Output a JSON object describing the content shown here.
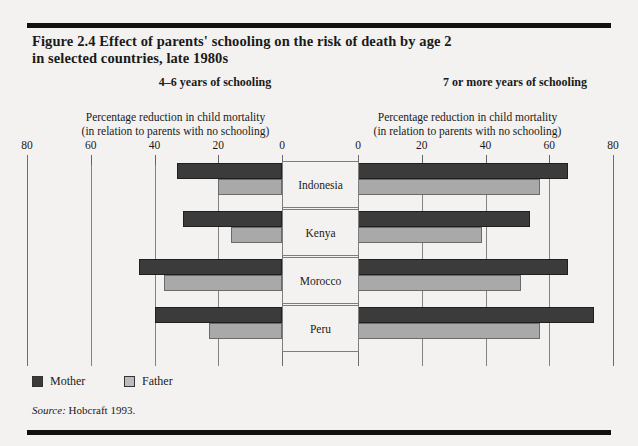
{
  "figure": {
    "title_line1": "Figure 2.4  Effect of parents' schooling on the risk of death by age 2",
    "title_line2": "in selected countries, late 1980s",
    "source_label": "Source:",
    "source_text": "Hobcraft 1993."
  },
  "legend": {
    "mother_label": "Mother",
    "father_label": "Father",
    "mother_color": "#3b3b3b",
    "father_color": "#bcbcbc"
  },
  "panels": {
    "left_heading": "4–6 years of schooling",
    "right_heading": "7 or more years of schooling",
    "caption_line1": "Percentage reduction in child mortality",
    "caption_line2": "(in relation to parents with no schooling)",
    "left_ticks": [
      "80",
      "60",
      "40",
      "20",
      "0"
    ],
    "right_ticks": [
      "0",
      "20",
      "40",
      "60",
      "80"
    ]
  },
  "chart_data": {
    "type": "bar",
    "orientation": "horizontal",
    "layout": "mirrored-pyramid",
    "title": "Figure 2.4  Effect of parents' schooling on the risk of death by age 2 in selected countries, late 1980s",
    "xlabel": "Percentage reduction in child mortality (in relation to parents with no schooling)",
    "ylabel": "",
    "categories": [
      "Indonesia",
      "Kenya",
      "Morocco",
      "Peru"
    ],
    "xlim": [
      0,
      80
    ],
    "xticks": [
      0,
      20,
      40,
      60,
      80
    ],
    "grid": true,
    "legend": [
      "Mother",
      "Father"
    ],
    "legend_position": "bottom-left",
    "panels": [
      {
        "name": "4–6 years of schooling",
        "direction": "left",
        "series": [
          {
            "name": "Mother",
            "values": [
              33,
              31,
              45,
              40
            ]
          },
          {
            "name": "Father",
            "values": [
              20,
              16,
              37,
              23
            ]
          }
        ]
      },
      {
        "name": "7 or more years of schooling",
        "direction": "right",
        "series": [
          {
            "name": "Mother",
            "values": [
              66,
              54,
              66,
              74
            ]
          },
          {
            "name": "Father",
            "values": [
              57,
              39,
              51,
              57
            ]
          }
        ]
      }
    ],
    "source": "Hobcraft 1993."
  }
}
